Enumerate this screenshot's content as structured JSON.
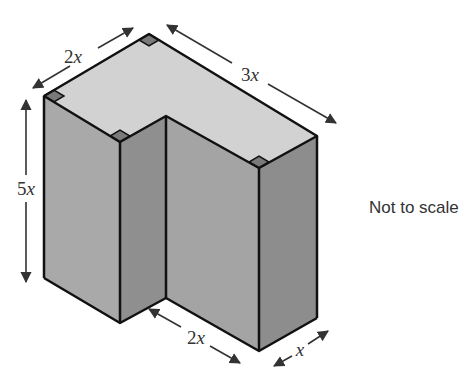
{
  "diagram": {
    "note": "Not to scale",
    "colors": {
      "top_face": "#d2d2d2",
      "front_left_face": "#a9a9a9",
      "inner_face": "#8f8f8f",
      "front_right_face": "#a4a4a4",
      "side_face": "#8d8d8d",
      "right_angle_marker": "#7a7a7a",
      "edge": "#111111",
      "arrow": "#333333"
    },
    "dimensions": [
      {
        "id": "top-left-width",
        "coefficient": "2",
        "variable": "x"
      },
      {
        "id": "top-right-length",
        "coefficient": "3",
        "variable": "x"
      },
      {
        "id": "height",
        "coefficient": "5",
        "variable": "x"
      },
      {
        "id": "bottom-inner-length",
        "coefficient": "2",
        "variable": "x"
      },
      {
        "id": "bottom-right-width",
        "coefficient": "",
        "variable": "x"
      }
    ]
  }
}
